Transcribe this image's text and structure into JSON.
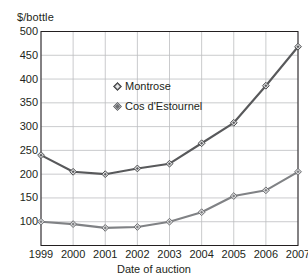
{
  "chart_data": {
    "type": "line",
    "title": "",
    "xlabel": "Date of auction",
    "ylabel": "$/bottle",
    "x": [
      "1999",
      "2000",
      "2001",
      "2002",
      "2003",
      "2004",
      "2005",
      "2006",
      "2007"
    ],
    "categories": [
      "1999",
      "2000",
      "2001",
      "2002",
      "2003",
      "2004",
      "2005",
      "2006",
      "2007"
    ],
    "ylim": [
      50,
      500
    ],
    "yticks": [
      500,
      450,
      400,
      350,
      300,
      250,
      200,
      150,
      100
    ],
    "ytick_labels": [
      "500",
      "450",
      "400",
      "350",
      "300",
      "250",
      "200",
      "150",
      "100"
    ],
    "grid": true,
    "legend_position": "inside-upper-left",
    "series": [
      {
        "name": "Montrose",
        "color": "#58595b",
        "marker": "diamond",
        "values": [
          240,
          205,
          200,
          212,
          222,
          265,
          308,
          386,
          468
        ]
      },
      {
        "name": "Cos d'Estournel",
        "color": "#808285",
        "marker": "diamond",
        "values": [
          100,
          95,
          87,
          89,
          100,
          120,
          154,
          166,
          205
        ]
      }
    ]
  },
  "legend": {
    "items": [
      {
        "label": "Montrose",
        "marker_fill": "#58595b",
        "marker_stroke": "#404041"
      },
      {
        "label": "Cos d'Estournel",
        "marker_fill": "#a7a9ac",
        "marker_stroke": "#58595b"
      }
    ]
  },
  "colors": {
    "axis": "#231f20",
    "grid": "#bcbec0",
    "series_montrose": "#58595b",
    "series_cos": "#808285",
    "background": "#ffffff"
  }
}
